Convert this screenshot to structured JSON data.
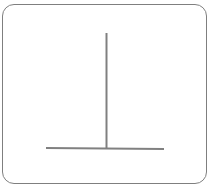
{
  "diagram": {
    "colors": {
      "stroke": "#808080",
      "frame": "#7f7f7f",
      "background": "#ffffff"
    },
    "vertical_line": {
      "x1": 106.5,
      "y1": 33,
      "x2": 106.5,
      "y2": 148
    },
    "horizontal_line": {
      "x1": 46,
      "y1": 148,
      "x2": 164,
      "y2": 149
    },
    "stroke_width": 2
  }
}
